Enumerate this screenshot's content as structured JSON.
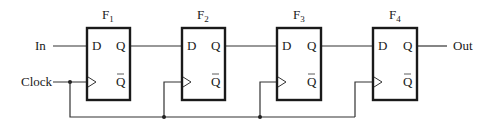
{
  "diagram": {
    "type": "shift-register",
    "inputs": {
      "data": "In",
      "clock": "Clock"
    },
    "output": "Out",
    "flipflops": [
      {
        "name": "F",
        "sub": "1",
        "d": "D",
        "q": "Q",
        "qbar": "Q"
      },
      {
        "name": "F",
        "sub": "2",
        "d": "D",
        "q": "Q",
        "qbar": "Q"
      },
      {
        "name": "F",
        "sub": "3",
        "d": "D",
        "q": "Q",
        "qbar": "Q"
      },
      {
        "name": "F",
        "sub": "4",
        "d": "D",
        "q": "Q",
        "qbar": "Q"
      }
    ]
  }
}
